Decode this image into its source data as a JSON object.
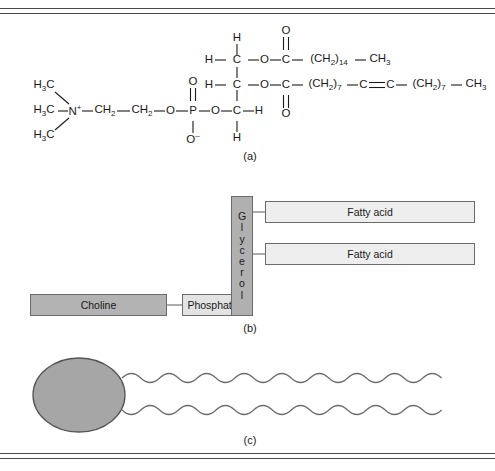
{
  "figure": {
    "border_color": "#4a4a4a",
    "background": "#ffffff"
  },
  "captions": {
    "a": "(a)",
    "b": "(b)",
    "c": "(c)"
  },
  "panel_a": {
    "description": "Full structural chemical formula of a phosphatidylcholine",
    "choline": {
      "methyl_top": "H",
      "methyl_top_sub": "3",
      "methyl_top_rest": "C",
      "methyl_mid": "H",
      "methyl_mid_sub": "3",
      "methyl_mid_rest": "C",
      "methyl_bot": "H",
      "methyl_bot_sub": "3",
      "methyl_bot_rest": "C",
      "nitrogen": "N",
      "nitrogen_charge": "+",
      "ch2_a": "CH",
      "ch2_a_sub": "2",
      "ch2_b": "CH",
      "ch2_b_sub": "2"
    },
    "phosphate": {
      "ester_oxygen": "O",
      "phosphorus": "P",
      "double_bond_oxygen": "O",
      "anionic_oxygen": "O",
      "anionic_charge": "–",
      "link_oxygen": "O"
    },
    "glycerol": {
      "c1": "C",
      "c1_h_top": "H",
      "c1_h_left": "H",
      "c2": "C",
      "c2_h_left": "H",
      "c3": "C",
      "c3_h_right": "H",
      "c3_h_bottom": "H"
    },
    "ester_1": {
      "oxygen": "O",
      "carbonyl_carbon": "C",
      "carbonyl_oxygen": "O",
      "chain": "(CH",
      "chain_sub": "2",
      "chain_close": ")",
      "chain_count": "14",
      "terminal": "CH",
      "terminal_sub": "3"
    },
    "ester_2": {
      "oxygen": "O",
      "carbonyl_carbon": "C",
      "carbonyl_oxygen": "O",
      "chain_a": "(CH",
      "chain_a_sub": "2",
      "chain_a_close": ")",
      "chain_a_count": "7",
      "alkene_c1": "C",
      "alkene_c2": "C",
      "chain_b": "(CH",
      "chain_b_sub": "2",
      "chain_b_close": ")",
      "chain_b_count": "7",
      "terminal": "CH",
      "terminal_sub": "3"
    }
  },
  "panel_b": {
    "description": "Schematic block diagram of phospholipid components",
    "choline_label": "Choline",
    "phosphate_label": "Phosphate",
    "glycerol_label": "Glycerol",
    "glycerol_letters": [
      "G",
      "l",
      "y",
      "c",
      "e",
      "r",
      "o",
      "l"
    ],
    "fatty_acid_1_label": "Fatty acid",
    "fatty_acid_2_label": "Fatty acid",
    "colors": {
      "choline_fill": "#b3b3b3",
      "phosphate_fill": "#e3e3e3",
      "glycerol_fill": "#b0b0b0",
      "fatty_acid_fill": "#eeeeee",
      "box_border": "#6b6b6b"
    }
  },
  "panel_c": {
    "description": "Simplified symbol: polar head group with two wavy hydrocarbon tails",
    "head_label": "polar-head-ellipse",
    "tail_1_label": "hydrocarbon-tail",
    "tail_2_label": "hydrocarbon-tail",
    "colors": {
      "head_fill": "#a6a6a6",
      "head_stroke": "#555555",
      "tail_stroke": "#6b6b6b"
    }
  }
}
